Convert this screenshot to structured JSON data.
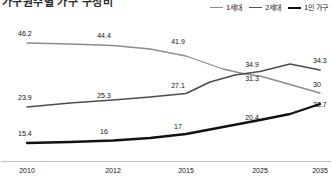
{
  "header": {
    "title": "가구원수별 가구 구성비",
    "title_clipped": true
  },
  "legend": {
    "position": "top-right",
    "items": [
      {
        "label": "1세대",
        "color": "#8c8c8c",
        "width": 1.2
      },
      {
        "label": "2세대",
        "color": "#4d4d4d",
        "width": 1.6
      },
      {
        "label": "1인 가구",
        "color": "#111111",
        "width": 2.2
      }
    ]
  },
  "axis": {
    "x_ticks": [
      "2010",
      "2012",
      "2015",
      "2025",
      "2035"
    ],
    "x_positions": [
      27,
      113,
      186,
      260,
      320
    ],
    "line_color": "#bdbdbd"
  },
  "chart_data": {
    "type": "line",
    "title": "가구원수별 가구 구성비",
    "xlabel": "",
    "ylabel": "",
    "categories": [
      "2010",
      "2012",
      "2015",
      "2025",
      "2035"
    ],
    "ylim": [
      10,
      50
    ],
    "grid": false,
    "legend_position": "top-right",
    "series": [
      {
        "name": "1세대",
        "color": "#8c8c8c",
        "values": [
          46.2,
          44.4,
          41.9,
          34.9,
          30
        ],
        "labels": [
          "46.2",
          "44.4",
          "41.9",
          "34.9",
          "30"
        ]
      },
      {
        "name": "2세대",
        "color": "#4d4d4d",
        "values": [
          23.9,
          25.3,
          27.1,
          31.3,
          34.3
        ],
        "labels": [
          "23.9",
          "25.3",
          "27.1",
          "31.3",
          "34.3"
        ]
      },
      {
        "name": "1인 가구",
        "color": "#111111",
        "values": [
          15.4,
          16,
          17,
          20.4,
          22.7
        ],
        "labels": [
          "15.4",
          "16",
          "17",
          "20.4",
          "22.7"
        ]
      }
    ]
  },
  "labels": {
    "s1": [
      {
        "text": "46.2",
        "x": 18,
        "y": 22,
        "anchor": "start"
      },
      {
        "text": "44.4",
        "x": 104,
        "y": 24,
        "anchor": "middle"
      },
      {
        "text": "41.9",
        "x": 178,
        "y": 30,
        "anchor": "middle"
      },
      {
        "text": "34.9",
        "x": 252,
        "y": 53,
        "anchor": "middle"
      },
      {
        "text": "30",
        "x": 313,
        "y": 73,
        "anchor": "start"
      }
    ],
    "s2": [
      {
        "text": "23.9",
        "x": 18,
        "y": 86,
        "anchor": "start"
      },
      {
        "text": "25.3",
        "x": 104,
        "y": 84,
        "anchor": "middle"
      },
      {
        "text": "27.1",
        "x": 178,
        "y": 74,
        "anchor": "middle"
      },
      {
        "text": "31.3",
        "x": 252,
        "y": 67,
        "anchor": "middle"
      },
      {
        "text": "34.3",
        "x": 313,
        "y": 49,
        "anchor": "start"
      }
    ],
    "s3": [
      {
        "text": "15.4",
        "x": 18,
        "y": 122,
        "anchor": "start"
      },
      {
        "text": "16",
        "x": 104,
        "y": 120,
        "anchor": "middle"
      },
      {
        "text": "17",
        "x": 178,
        "y": 115,
        "anchor": "middle"
      },
      {
        "text": "20.4",
        "x": 252,
        "y": 106,
        "anchor": "middle"
      },
      {
        "text": "22.7",
        "x": 313,
        "y": 93,
        "anchor": "start"
      }
    ]
  },
  "paths": {
    "s1": "M 27,27 L 70,28 L 113,29.5 L 150,33 L 186,40 L 223,53 L 245,58 L 260,60 L 290,68.5 L 320,77",
    "s2": "M 27,91 L 70,87 L 113,84 L 150,81 L 186,77.5 L 210,66 L 235,59 L 260,55.5 L 290,48 L 320,54",
    "s3": "M 27,127 L 70,126 L 113,124.5 L 150,122 L 186,118 L 223,111 L 260,104 L 290,98 L 320,88"
  }
}
